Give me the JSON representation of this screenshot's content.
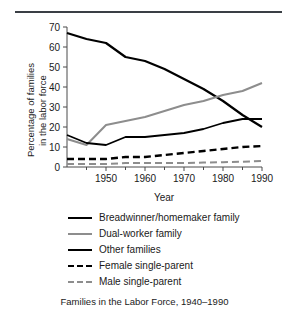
{
  "figure": {
    "caption": "Families in the Labor Force, 1940–1990",
    "rule_color": "#3a3f45"
  },
  "chart_data": {
    "type": "line",
    "title": "",
    "xlabel": "Year",
    "ylabel_line1": "Percentage of families",
    "ylabel_line2": "in the labor force",
    "x": [
      1940,
      1945,
      1950,
      1955,
      1960,
      1965,
      1970,
      1975,
      1980,
      1985,
      1990
    ],
    "xlim": [
      1940,
      1990
    ],
    "ylim": [
      0,
      70
    ],
    "xticks_major": [
      1950,
      1960,
      1970,
      1980,
      1990
    ],
    "xticks_minor": [
      1945,
      1955,
      1965,
      1975,
      1985
    ],
    "yticks": [
      0,
      10,
      20,
      30,
      40,
      50,
      60,
      70
    ],
    "grid": false,
    "legend_position": "below",
    "series": [
      {
        "name": "Breadwinner/homemaker family",
        "values": [
          67,
          64,
          62,
          55,
          53,
          49,
          44,
          39,
          33,
          26,
          20
        ],
        "color": "#000000",
        "dash": "none",
        "width": 2.2
      },
      {
        "name": "Dual-worker family",
        "values": [
          14,
          11,
          21,
          23,
          25,
          28,
          31,
          33,
          36,
          38,
          42
        ],
        "color": "#8d8d8d",
        "dash": "none",
        "width": 2.0
      },
      {
        "name": "Other families",
        "values": [
          16,
          12,
          11,
          15,
          15,
          16,
          17,
          19,
          22,
          24,
          24
        ],
        "color": "#000000",
        "dash": "none",
        "width": 1.8
      },
      {
        "name": "Female single-parent",
        "values": [
          4,
          4,
          4,
          5,
          5,
          6,
          7,
          8,
          9,
          10,
          10.5
        ],
        "color": "#000000",
        "dash": "dashed",
        "width": 2.4
      },
      {
        "name": "Male single-parent",
        "values": [
          1.5,
          1.5,
          1.5,
          2,
          2,
          2,
          2,
          2.2,
          2.4,
          2.6,
          3
        ],
        "color": "#8d8d8d",
        "dash": "dashed",
        "width": 2.0
      }
    ]
  }
}
